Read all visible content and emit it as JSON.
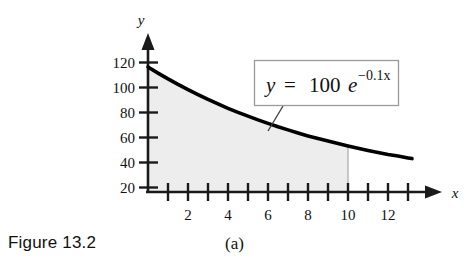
{
  "figure": {
    "caption": "Figure 13.2",
    "subcaption": "(a)"
  },
  "chart_data": {
    "type": "line",
    "title": "",
    "subtitle": "",
    "xlabel": "x",
    "ylabel": "y",
    "equation_label": "y = 100e",
    "equation_exponent": "−0.1x",
    "function": "y = 100e^(-0.1x)",
    "xlim": [
      0,
      13.4
    ],
    "ylim": [
      0,
      132
    ],
    "grid": false,
    "legend_position": "none",
    "x_ticks": [
      1,
      2,
      3,
      4,
      5,
      6,
      7,
      8,
      9,
      10,
      11,
      12,
      13
    ],
    "x_tick_labels": [
      "2",
      "4",
      "6",
      "8",
      "10",
      "12"
    ],
    "x_tick_label_values": [
      2,
      4,
      6,
      8,
      10,
      12
    ],
    "y_ticks": [
      20,
      40,
      60,
      80,
      100,
      120
    ],
    "y_tick_labels": [
      "20",
      "40",
      "60",
      "80",
      "100",
      "120"
    ],
    "shaded_region": {
      "from": 0,
      "to": 10,
      "color": "#ededed",
      "label": "area under curve"
    },
    "series": [
      {
        "name": "y = 100e^(-0.1x)",
        "color": "#000000",
        "x": [
          0,
          0.5,
          1,
          1.5,
          2,
          2.5,
          3,
          3.5,
          4,
          4.5,
          5,
          5.5,
          6,
          6.5,
          7,
          7.5,
          8,
          8.5,
          9,
          9.5,
          10,
          10.5,
          11,
          11.5,
          12,
          12.5,
          13,
          13.2
        ],
        "values": [
          100,
          95.1,
          90.5,
          86.1,
          81.9,
          77.9,
          74.1,
          70.5,
          67,
          63.8,
          60.7,
          57.7,
          54.9,
          52.2,
          49.7,
          47.2,
          44.9,
          42.7,
          40.7,
          38.7,
          36.8,
          35,
          33.3,
          31.7,
          30.1,
          28.7,
          27.3,
          26.7
        ]
      }
    ],
    "curve_color": "#000000",
    "axis_color": "#1a1a1a",
    "label_box_border_color": "#9a9a9a"
  }
}
